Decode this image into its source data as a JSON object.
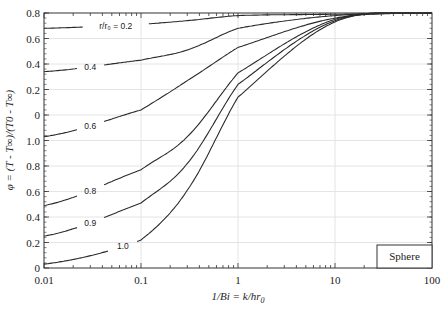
{
  "chart_data": {
    "type": "line",
    "title": "",
    "xlabel": "1/Bi = k/hr0",
    "ylabel": "φ = (T - T∞)/(T0 - T∞)",
    "xscale": "log",
    "xlim": [
      0.01,
      100
    ],
    "x_ticks": [
      "0.01",
      "0.1",
      "1",
      "10",
      "100"
    ],
    "y_ticks_top_to_bottom": [
      "0.8",
      "0.6",
      "0.4",
      "0.2",
      "0",
      "1.0",
      "0.8",
      "0.6",
      "0.4",
      "0.2",
      "0"
    ],
    "y_note": "Stacked y-axis: continuous internal scale 0–2.0 (bottom to top) rendered with two label sets",
    "ylim_internal": [
      0,
      2.0
    ],
    "grid": true,
    "legend_box": "Sphere",
    "x": [
      0.01,
      0.1,
      0.3,
      1,
      10,
      100
    ],
    "series": [
      {
        "name": "r/r0 = 0.2",
        "label": "r/r₀ = 0.2",
        "values": [
          1.88,
          1.91,
          1.94,
          1.98,
          1.99,
          2.0
        ]
      },
      {
        "name": "0.4",
        "label": "0.4",
        "values": [
          1.54,
          1.63,
          1.71,
          1.88,
          1.98,
          2.0
        ]
      },
      {
        "name": "0.6",
        "label": "0.6",
        "values": [
          1.03,
          1.24,
          1.47,
          1.73,
          1.96,
          2.0
        ]
      },
      {
        "name": "0.8",
        "label": "0.8",
        "values": [
          0.49,
          0.77,
          1.03,
          1.53,
          1.95,
          2.0
        ]
      },
      {
        "name": "0.9",
        "label": "0.9",
        "values": [
          0.25,
          0.51,
          0.82,
          1.44,
          1.94,
          2.0
        ]
      },
      {
        "name": "1.0",
        "label": "1.0",
        "values": [
          0.03,
          0.22,
          0.61,
          1.34,
          1.93,
          2.0
        ]
      }
    ],
    "label_positions": [
      {
        "series": 0,
        "x": 0.055
      },
      {
        "series": 1,
        "x": 0.03
      },
      {
        "series": 2,
        "x": 0.03
      },
      {
        "series": 3,
        "x": 0.03
      },
      {
        "series": 4,
        "x": 0.03
      },
      {
        "series": 5,
        "x": 0.065
      }
    ]
  },
  "axis": {
    "xlabel_main": "1/Bi = k/hr",
    "xlabel_sub": "0",
    "ylabel_text": "φ = (T - T∞)/(T0 - T∞)"
  },
  "legend": {
    "label": "Sphere"
  },
  "colors": {
    "curve": "#2a2a2a",
    "grid": "#e4e4e4",
    "axis": "#333333"
  }
}
